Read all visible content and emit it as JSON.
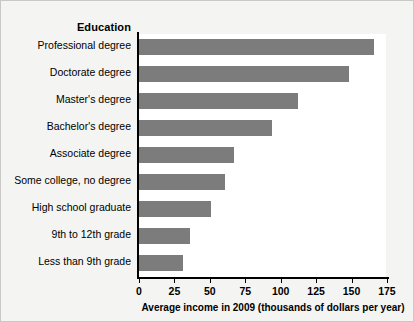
{
  "chart_data": {
    "type": "bar",
    "orientation": "horizontal",
    "title": "",
    "category_axis_title": "Education",
    "xlabel": "Average income in 2009 (thousands of dollars per year)",
    "ylabel": "",
    "xlim": [
      0,
      180
    ],
    "xticks": [
      0,
      25,
      50,
      75,
      100,
      125,
      150,
      175
    ],
    "grid": false,
    "legend": null,
    "bar_color": "#7c7c7c",
    "background_color": "#f4f4f2",
    "plot_background_color": "#ffffff",
    "axis_color": "#000000",
    "categories": [
      "Professional degree",
      "Doctorate degree",
      "Master's degree",
      "Bachelor's degree",
      "Associate degree",
      "Some college, no degree",
      "High school graduate",
      "9th to 12th grade",
      "Less than 9th grade"
    ],
    "values": [
      166,
      148,
      112,
      94,
      67,
      61,
      51,
      36,
      31
    ]
  }
}
